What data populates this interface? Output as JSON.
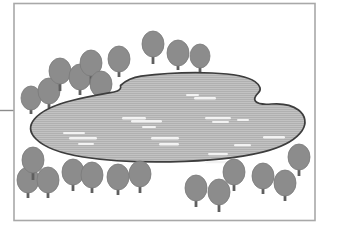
{
  "figure": {
    "canvas": {
      "width": 339,
      "height": 238,
      "background": "#ffffff"
    }
  },
  "frame": {
    "name": "border-rectangle",
    "x": 14,
    "y": 3.5,
    "width": 301,
    "height": 217,
    "stroke": "#a8a8a8",
    "stroke_width": 1.6,
    "fill": "none"
  },
  "leader_line": {
    "name": "leader-line-left",
    "x1": 0,
    "y1": 110.5,
    "x2": 14,
    "y2": 110.5,
    "stroke": "#8c8c8c",
    "stroke_width": 1.4
  },
  "lake": {
    "label": "lake",
    "fill": "#b0b0b0",
    "stroke": "#3d3d3d",
    "stroke_width": 1.7,
    "hatch": {
      "type": "horizontal-lines",
      "color": "#c4c4c4",
      "spacing": 2,
      "stroke_width": 0.8
    },
    "path": "M 120.5 85.5 C 126 80.5 131 77.5 141 76.2 C 160 73.7 190 72.2 212 73.0 C 232 73.8 248 76.6 255 81.6 C 260.5 85.5 261.5 89.6 258.5 92.6 C 255.2 95.9 253.6 99.0 255.6 101.4 C 258.0 104.3 264.0 104.6 271.5 104.0 C 281.5 103.2 292.0 105.1 298.5 110.0 C 305.5 115.3 307.0 123.5 302.0 130.8 C 296.0 139.5 284.0 146.0 269.0 150.4 C 248.0 156.6 218.0 160.2 185.0 161.4 C 148.0 162.7 110.0 161.3 83.0 157.0 C 60.0 153.3 44.0 147.0 36.0 139.0 C 29.5 132.6 29.0 125.5 34.5 119.0 C 41.0 111.3 54.0 105.0 72.0 100.5 C 88.0 96.5 104.0 93.8 114.0 92.0 C 119.5 91.0 121.5 88.5 120.5 85.5 Z"
  },
  "ripples": {
    "name": "water-ripple-marks",
    "color": "#f2f2f2",
    "marks": [
      {
        "x": 63,
        "y": 132,
        "w": 22,
        "h": 2.1
      },
      {
        "x": 69,
        "y": 137,
        "w": 28,
        "h": 2.6
      },
      {
        "x": 78,
        "y": 143,
        "w": 16,
        "h": 2.0
      },
      {
        "x": 122,
        "y": 117,
        "w": 24,
        "h": 2.4
      },
      {
        "x": 131,
        "y": 120,
        "w": 31,
        "h": 2.6
      },
      {
        "x": 142,
        "y": 126,
        "w": 14,
        "h": 1.9
      },
      {
        "x": 151,
        "y": 137,
        "w": 28,
        "h": 2.4
      },
      {
        "x": 159,
        "y": 143,
        "w": 20,
        "h": 2.4
      },
      {
        "x": 186,
        "y": 94,
        "w": 13,
        "h": 2.0
      },
      {
        "x": 194,
        "y": 97,
        "w": 22,
        "h": 2.5
      },
      {
        "x": 205,
        "y": 117,
        "w": 26,
        "h": 2.3
      },
      {
        "x": 212,
        "y": 121,
        "w": 17,
        "h": 2.1
      },
      {
        "x": 208,
        "y": 153,
        "w": 20,
        "h": 2.2
      },
      {
        "x": 234,
        "y": 144,
        "w": 17,
        "h": 2.3
      },
      {
        "x": 205,
        "y": 161,
        "w": 23,
        "h": 2.2
      },
      {
        "x": 263,
        "y": 136,
        "w": 22,
        "h": 2.4
      },
      {
        "x": 237,
        "y": 119,
        "w": 12,
        "h": 1.9
      }
    ]
  },
  "trees": {
    "name": "tree-group",
    "crown_fill": "#8c8c8c",
    "crown_stroke": "#7a7a7a",
    "trunk_fill": "#5f5f5f",
    "items": [
      {
        "id": "tree-top-left-1",
        "cx": 31,
        "cy": 98,
        "rx": 10,
        "ry": 12,
        "trunk_h": 16
      },
      {
        "id": "tree-top-left-2",
        "cx": 49,
        "cy": 91,
        "rx": 11,
        "ry": 13,
        "trunk_h": 17
      },
      {
        "id": "tree-top-left-3",
        "cx": 60,
        "cy": 71,
        "rx": 11,
        "ry": 13,
        "trunk_h": 20
      },
      {
        "id": "tree-top-left-4",
        "cx": 80,
        "cy": 77,
        "rx": 11,
        "ry": 13,
        "trunk_h": 18
      },
      {
        "id": "tree-top-left-5",
        "cx": 91,
        "cy": 63,
        "rx": 11,
        "ry": 13,
        "trunk_h": 22
      },
      {
        "id": "tree-top-mid-1",
        "cx": 101,
        "cy": 84,
        "rx": 11,
        "ry": 13,
        "trunk_h": 16
      },
      {
        "id": "tree-top-mid-2",
        "cx": 119,
        "cy": 59,
        "rx": 11,
        "ry": 13,
        "trunk_h": 18
      },
      {
        "id": "tree-top-mid-3",
        "cx": 153,
        "cy": 44,
        "rx": 11,
        "ry": 13,
        "trunk_h": 20
      },
      {
        "id": "tree-top-mid-4",
        "cx": 178,
        "cy": 53,
        "rx": 11,
        "ry": 13,
        "trunk_h": 17
      },
      {
        "id": "tree-top-right-1",
        "cx": 200,
        "cy": 56,
        "rx": 10,
        "ry": 12,
        "trunk_h": 17
      },
      {
        "id": "tree-bot-left-1",
        "cx": 28,
        "cy": 180,
        "rx": 11,
        "ry": 13,
        "trunk_h": 18
      },
      {
        "id": "tree-bot-left-2",
        "cx": 33,
        "cy": 160,
        "rx": 11,
        "ry": 13,
        "trunk_h": 20
      },
      {
        "id": "tree-bot-left-3",
        "cx": 48,
        "cy": 180,
        "rx": 11,
        "ry": 13,
        "trunk_h": 18
      },
      {
        "id": "tree-bot-left-4",
        "cx": 73,
        "cy": 172,
        "rx": 11,
        "ry": 13,
        "trunk_h": 19
      },
      {
        "id": "tree-bot-left-5",
        "cx": 92,
        "cy": 175,
        "rx": 11,
        "ry": 13,
        "trunk_h": 18
      },
      {
        "id": "tree-bot-mid-1",
        "cx": 118,
        "cy": 177,
        "rx": 11,
        "ry": 13,
        "trunk_h": 18
      },
      {
        "id": "tree-bot-mid-2",
        "cx": 140,
        "cy": 174,
        "rx": 11,
        "ry": 13,
        "trunk_h": 19
      },
      {
        "id": "tree-bot-mid-3",
        "cx": 196,
        "cy": 188,
        "rx": 11,
        "ry": 13,
        "trunk_h": 19
      },
      {
        "id": "tree-bot-mid-4",
        "cx": 219,
        "cy": 192,
        "rx": 11,
        "ry": 13,
        "trunk_h": 20
      },
      {
        "id": "tree-bot-right-1",
        "cx": 234,
        "cy": 172,
        "rx": 11,
        "ry": 13,
        "trunk_h": 19
      },
      {
        "id": "tree-bot-right-2",
        "cx": 263,
        "cy": 176,
        "rx": 11,
        "ry": 13,
        "trunk_h": 18
      },
      {
        "id": "tree-bot-right-3",
        "cx": 285,
        "cy": 183,
        "rx": 11,
        "ry": 13,
        "trunk_h": 18
      },
      {
        "id": "tree-bot-right-4",
        "cx": 299,
        "cy": 157,
        "rx": 11,
        "ry": 13,
        "trunk_h": 19
      }
    ]
  }
}
